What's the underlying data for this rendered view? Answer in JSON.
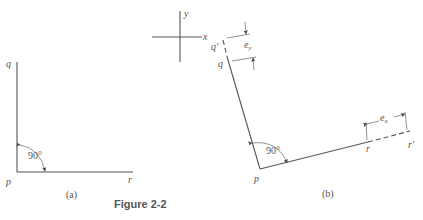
{
  "figure": {
    "caption": "Figure 2-2",
    "panel_a": {
      "label": "(a)",
      "points": {
        "q": "q",
        "p": "p",
        "r": "r"
      },
      "angle": "90°"
    },
    "panel_b": {
      "label": "(b)",
      "points": {
        "q_prime": "q'",
        "q": "q",
        "p": "p",
        "r": "r",
        "r_prime": "r'"
      },
      "angle": "90°",
      "offsets": {
        "ex": "e",
        "ex_sub": "x",
        "ey": "e",
        "ey_sub": "y"
      }
    },
    "axes": {
      "x": "x",
      "y": "y"
    }
  }
}
